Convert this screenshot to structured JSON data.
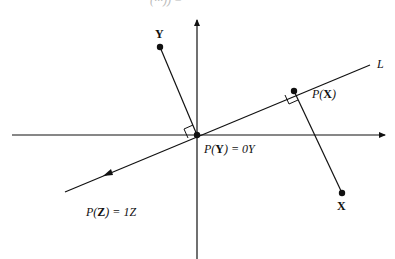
{
  "header": {
    "cut_off_text": "(···)) ="
  },
  "colors": {
    "ink": "#111111",
    "background": "#ffffff"
  },
  "diagram": {
    "origin": {
      "x": 197,
      "y": 135
    },
    "axes": {
      "horizontal": {
        "x1": 12,
        "x2": 385,
        "y": 135
      },
      "vertical": {
        "x": 197,
        "y1": 259,
        "y2": 20
      }
    },
    "line_L": {
      "x1": 65,
      "y1": 192,
      "x2": 370,
      "y2": 65,
      "label": "L"
    },
    "points": {
      "Y": {
        "x": 160,
        "y": 47,
        "label": "Y"
      },
      "X": {
        "x": 342,
        "y": 193,
        "label": "X"
      },
      "PX": {
        "x": 294,
        "y": 91
      }
    },
    "labels": {
      "px_prefix": "P(",
      "px_var": "X",
      "px_suffix": ")",
      "py_prefix": "P(",
      "py_var": "Y",
      "py_suffix": ") = 0Y",
      "pz_prefix": "P(",
      "pz_var": "Z",
      "pz_suffix": ") = 1Z"
    }
  }
}
